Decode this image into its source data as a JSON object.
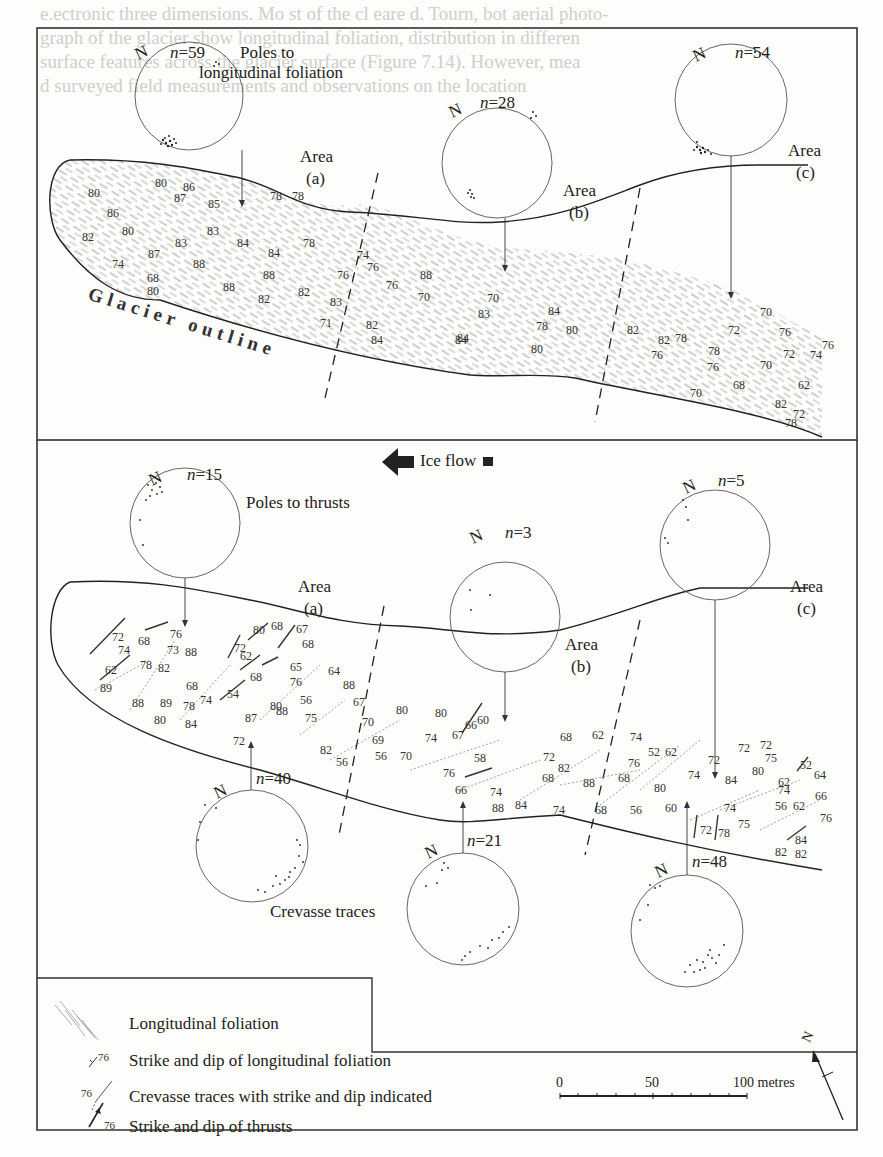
{
  "figure": {
    "background_color": "#fdfdfb",
    "ink_color": "#222222",
    "upper_panel": {
      "title_line1": "Poles to",
      "title_line2": "longitudinal foliation",
      "outline_label": "Glacier outline",
      "stereonets": [
        {
          "north": "N",
          "n_label": "n",
          "n_value": "=59",
          "area_word": "Area",
          "area_id": "(a)"
        },
        {
          "north": "N",
          "n_label": "n",
          "n_value": "=28",
          "area_word": "Area",
          "area_id": "(b)"
        },
        {
          "north": "N",
          "n_label": "n",
          "n_value": "=54",
          "area_word": "Area",
          "area_id": "(c)"
        }
      ],
      "foliation_dips": [
        {
          "x": 88,
          "y": 193,
          "v": "80"
        },
        {
          "x": 155,
          "y": 183,
          "v": "80"
        },
        {
          "x": 183,
          "y": 187,
          "v": "86"
        },
        {
          "x": 174,
          "y": 198,
          "v": "87"
        },
        {
          "x": 208,
          "y": 204,
          "v": "85"
        },
        {
          "x": 270,
          "y": 196,
          "v": "78"
        },
        {
          "x": 292,
          "y": 196,
          "v": "78"
        },
        {
          "x": 107,
          "y": 213,
          "v": "86"
        },
        {
          "x": 122,
          "y": 231,
          "v": "80"
        },
        {
          "x": 82,
          "y": 237,
          "v": "82"
        },
        {
          "x": 207,
          "y": 231,
          "v": "83"
        },
        {
          "x": 175,
          "y": 243,
          "v": "83"
        },
        {
          "x": 237,
          "y": 243,
          "v": "84"
        },
        {
          "x": 268,
          "y": 253,
          "v": "84"
        },
        {
          "x": 303,
          "y": 243,
          "v": "78"
        },
        {
          "x": 357,
          "y": 255,
          "v": "74"
        },
        {
          "x": 148,
          "y": 254,
          "v": "87"
        },
        {
          "x": 193,
          "y": 264,
          "v": "88"
        },
        {
          "x": 112,
          "y": 264,
          "v": "74"
        },
        {
          "x": 263,
          "y": 275,
          "v": "88"
        },
        {
          "x": 337,
          "y": 275,
          "v": "76"
        },
        {
          "x": 367,
          "y": 267,
          "v": "76"
        },
        {
          "x": 147,
          "y": 278,
          "v": "68"
        },
        {
          "x": 223,
          "y": 287,
          "v": "88"
        },
        {
          "x": 147,
          "y": 291,
          "v": "80"
        },
        {
          "x": 298,
          "y": 292,
          "v": "82"
        },
        {
          "x": 258,
          "y": 299,
          "v": "82"
        },
        {
          "x": 330,
          "y": 302,
          "v": "83"
        },
        {
          "x": 386,
          "y": 285,
          "v": "76"
        },
        {
          "x": 418,
          "y": 297,
          "v": "70"
        },
        {
          "x": 420,
          "y": 275,
          "v": "88"
        },
        {
          "x": 320,
          "y": 323,
          "v": "71"
        },
        {
          "x": 366,
          "y": 325,
          "v": "82"
        },
        {
          "x": 371,
          "y": 340,
          "v": "84"
        },
        {
          "x": 455,
          "y": 340,
          "v": "84"
        },
        {
          "x": 487,
          "y": 298,
          "v": "70"
        },
        {
          "x": 478,
          "y": 314,
          "v": "83"
        },
        {
          "x": 548,
          "y": 311,
          "v": "84"
        },
        {
          "x": 536,
          "y": 326,
          "v": "78"
        },
        {
          "x": 566,
          "y": 330,
          "v": "80"
        },
        {
          "x": 531,
          "y": 349,
          "v": "80"
        },
        {
          "x": 457,
          "y": 338,
          "v": "84"
        },
        {
          "x": 627,
          "y": 330,
          "v": "82"
        },
        {
          "x": 658,
          "y": 340,
          "v": "82"
        },
        {
          "x": 675,
          "y": 338,
          "v": "78"
        },
        {
          "x": 651,
          "y": 355,
          "v": "76"
        },
        {
          "x": 708,
          "y": 351,
          "v": "78"
        },
        {
          "x": 707,
          "y": 367,
          "v": "76"
        },
        {
          "x": 728,
          "y": 330,
          "v": "72"
        },
        {
          "x": 760,
          "y": 312,
          "v": "70"
        },
        {
          "x": 779,
          "y": 332,
          "v": "76"
        },
        {
          "x": 783,
          "y": 354,
          "v": "72"
        },
        {
          "x": 810,
          "y": 355,
          "v": "74"
        },
        {
          "x": 822,
          "y": 345,
          "v": "76"
        },
        {
          "x": 760,
          "y": 365,
          "v": "70"
        },
        {
          "x": 733,
          "y": 385,
          "v": "68"
        },
        {
          "x": 690,
          "y": 393,
          "v": "70"
        },
        {
          "x": 798,
          "y": 385,
          "v": "62"
        },
        {
          "x": 775,
          "y": 404,
          "v": "82"
        },
        {
          "x": 793,
          "y": 414,
          "v": "72"
        },
        {
          "x": 785,
          "y": 423,
          "v": "78"
        }
      ]
    },
    "ice_flow": {
      "label": "Ice flow"
    },
    "lower_panel": {
      "upper_stereonets_title": "Poles to thrusts",
      "lower_stereonets_title": "Crevasse traces",
      "thrust_stereonets": [
        {
          "north": "N",
          "n_label": "n",
          "n_value": "=15"
        },
        {
          "north": "N",
          "n_label": "n",
          "n_value": "=3"
        },
        {
          "north": "N",
          "n_label": "n",
          "n_value": "=5"
        }
      ],
      "crevasse_stereonets": [
        {
          "north": "N",
          "n_label": "n",
          "n_value": "=40"
        },
        {
          "north": "N",
          "n_label": "n",
          "n_value": "=21"
        },
        {
          "north": "N",
          "n_label": "n",
          "n_value": "=48"
        }
      ],
      "areas": [
        {
          "area_word": "Area",
          "area_id": "(a)"
        },
        {
          "area_word": "Area",
          "area_id": "(b)"
        },
        {
          "area_word": "Area",
          "area_id": "(c)"
        }
      ],
      "thrust_dips": [
        {
          "x": 112,
          "y": 637,
          "v": "72"
        },
        {
          "x": 118,
          "y": 650,
          "v": "74"
        },
        {
          "x": 138,
          "y": 641,
          "v": "68"
        },
        {
          "x": 170,
          "y": 634,
          "v": "76"
        },
        {
          "x": 167,
          "y": 650,
          "v": "73"
        },
        {
          "x": 234,
          "y": 648,
          "v": "72"
        },
        {
          "x": 253,
          "y": 630,
          "v": "80"
        },
        {
          "x": 271,
          "y": 626,
          "v": "68"
        },
        {
          "x": 296,
          "y": 629,
          "v": "67"
        },
        {
          "x": 302,
          "y": 644,
          "v": "68"
        },
        {
          "x": 240,
          "y": 656,
          "v": "62"
        },
        {
          "x": 290,
          "y": 667,
          "v": "65"
        },
        {
          "x": 105,
          "y": 670,
          "v": "62"
        },
        {
          "x": 250,
          "y": 677,
          "v": "68"
        },
        {
          "x": 227,
          "y": 694,
          "v": "54"
        },
        {
          "x": 290,
          "y": 682,
          "v": "76"
        },
        {
          "x": 328,
          "y": 671,
          "v": "64"
        },
        {
          "x": 477,
          "y": 720,
          "v": "60"
        },
        {
          "x": 474,
          "y": 758,
          "v": "58"
        },
        {
          "x": 760,
          "y": 745,
          "v": "72"
        },
        {
          "x": 800,
          "y": 765,
          "v": "52"
        },
        {
          "x": 700,
          "y": 830,
          "v": "72"
        },
        {
          "x": 718,
          "y": 833,
          "v": "78"
        },
        {
          "x": 795,
          "y": 840,
          "v": "84"
        }
      ],
      "crevasse_dips": [
        {
          "x": 100,
          "y": 688,
          "v": "89"
        },
        {
          "x": 140,
          "y": 665,
          "v": "78"
        },
        {
          "x": 158,
          "y": 668,
          "v": "82"
        },
        {
          "x": 185,
          "y": 652,
          "v": "88"
        },
        {
          "x": 186,
          "y": 686,
          "v": "68"
        },
        {
          "x": 132,
          "y": 703,
          "v": "88"
        },
        {
          "x": 160,
          "y": 703,
          "v": "89"
        },
        {
          "x": 154,
          "y": 720,
          "v": "80"
        },
        {
          "x": 183,
          "y": 706,
          "v": "78"
        },
        {
          "x": 200,
          "y": 700,
          "v": "74"
        },
        {
          "x": 185,
          "y": 724,
          "v": "84"
        },
        {
          "x": 245,
          "y": 718,
          "v": "87"
        },
        {
          "x": 270,
          "y": 706,
          "v": "80"
        },
        {
          "x": 276,
          "y": 711,
          "v": "88"
        },
        {
          "x": 300,
          "y": 700,
          "v": "56"
        },
        {
          "x": 343,
          "y": 685,
          "v": "88"
        },
        {
          "x": 353,
          "y": 702,
          "v": "67"
        },
        {
          "x": 305,
          "y": 718,
          "v": "75"
        },
        {
          "x": 362,
          "y": 722,
          "v": "70"
        },
        {
          "x": 233,
          "y": 741,
          "v": "72"
        },
        {
          "x": 320,
          "y": 750,
          "v": "82"
        },
        {
          "x": 336,
          "y": 762,
          "v": "56"
        },
        {
          "x": 396,
          "y": 710,
          "v": "80"
        },
        {
          "x": 435,
          "y": 713,
          "v": "80"
        },
        {
          "x": 372,
          "y": 740,
          "v": "69"
        },
        {
          "x": 375,
          "y": 756,
          "v": "56"
        },
        {
          "x": 400,
          "y": 756,
          "v": "70"
        },
        {
          "x": 425,
          "y": 738,
          "v": "74"
        },
        {
          "x": 452,
          "y": 735,
          "v": "67"
        },
        {
          "x": 465,
          "y": 725,
          "v": "66"
        },
        {
          "x": 443,
          "y": 773,
          "v": "76"
        },
        {
          "x": 455,
          "y": 790,
          "v": "66"
        },
        {
          "x": 490,
          "y": 792,
          "v": "74"
        },
        {
          "x": 492,
          "y": 808,
          "v": "88"
        },
        {
          "x": 515,
          "y": 805,
          "v": "84"
        },
        {
          "x": 553,
          "y": 810,
          "v": "74"
        },
        {
          "x": 595,
          "y": 810,
          "v": "68"
        },
        {
          "x": 560,
          "y": 737,
          "v": "68"
        },
        {
          "x": 592,
          "y": 735,
          "v": "62"
        },
        {
          "x": 543,
          "y": 757,
          "v": "72"
        },
        {
          "x": 558,
          "y": 768,
          "v": "82"
        },
        {
          "x": 542,
          "y": 778,
          "v": "68"
        },
        {
          "x": 583,
          "y": 783,
          "v": "88"
        },
        {
          "x": 630,
          "y": 737,
          "v": "74"
        },
        {
          "x": 648,
          "y": 752,
          "v": "52"
        },
        {
          "x": 628,
          "y": 763,
          "v": "76"
        },
        {
          "x": 618,
          "y": 778,
          "v": "68"
        },
        {
          "x": 665,
          "y": 752,
          "v": "62"
        },
        {
          "x": 654,
          "y": 788,
          "v": "80"
        },
        {
          "x": 630,
          "y": 810,
          "v": "56"
        },
        {
          "x": 665,
          "y": 808,
          "v": "60"
        },
        {
          "x": 688,
          "y": 775,
          "v": "74"
        },
        {
          "x": 708,
          "y": 760,
          "v": "72"
        },
        {
          "x": 725,
          "y": 780,
          "v": "84"
        },
        {
          "x": 738,
          "y": 748,
          "v": "72"
        },
        {
          "x": 752,
          "y": 771,
          "v": "80"
        },
        {
          "x": 765,
          "y": 758,
          "v": "75"
        },
        {
          "x": 778,
          "y": 782,
          "v": "62"
        },
        {
          "x": 724,
          "y": 808,
          "v": "74"
        },
        {
          "x": 738,
          "y": 824,
          "v": "75"
        },
        {
          "x": 778,
          "y": 790,
          "v": "74"
        },
        {
          "x": 775,
          "y": 806,
          "v": "56"
        },
        {
          "x": 793,
          "y": 806,
          "v": "62"
        },
        {
          "x": 814,
          "y": 775,
          "v": "64"
        },
        {
          "x": 815,
          "y": 796,
          "v": "66"
        },
        {
          "x": 820,
          "y": 818,
          "v": "76"
        },
        {
          "x": 775,
          "y": 852,
          "v": "82"
        },
        {
          "x": 795,
          "y": 854,
          "v": "82"
        }
      ]
    },
    "legend": {
      "items": [
        {
          "symbol": "foliation-hatch",
          "label": "Longitudinal foliation"
        },
        {
          "symbol_value": "76",
          "label": "Strike and dip of longitudinal foliation"
        },
        {
          "symbol_value": "76",
          "label": "Crevasse traces with strike and dip indicated"
        },
        {
          "symbol_value": "76",
          "label": "Strike and dip of thrusts"
        }
      ],
      "scale_bar": {
        "ticks": [
          "0",
          "50",
          "100 metres"
        ]
      },
      "north_arrow": {
        "label": "N"
      }
    },
    "bleed_through_text": [
      "e.ectronic three dimensions. Mo st of the cl eare d. Tourn, bot aerial photo-",
      "graph of the glacier show longitudinal foliation, distribution in differen",
      "surface features across the glacier surface (Figure 7.14). However, mea",
      "d surveyed field measurements and observations on the location"
    ]
  }
}
